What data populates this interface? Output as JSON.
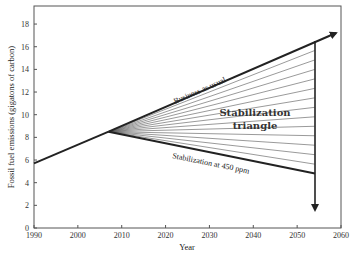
{
  "chart_data": {
    "type": "line",
    "title": "",
    "xlabel": "Year",
    "ylabel": "Fossil fuel emissions (gigatons of carbon)",
    "xlim": [
      1990,
      2060
    ],
    "ylim": [
      0,
      19
    ],
    "x_ticks": [
      1990,
      2000,
      2010,
      2020,
      2030,
      2040,
      2050,
      2060
    ],
    "y_ticks": [
      0,
      2,
      4,
      6,
      8,
      10,
      12,
      14,
      16,
      18
    ],
    "grid": false,
    "series": [
      {
        "name": "Historical",
        "x": [
          1990,
          2007
        ],
        "y": [
          5.7,
          8.5
        ]
      },
      {
        "name": "Business as usual",
        "x": [
          2007,
          2054,
          2059
        ],
        "y": [
          8.5,
          16.5,
          17.2
        ]
      },
      {
        "name": "Stabilization at 450 ppm",
        "x": [
          2007,
          2054
        ],
        "y": [
          8.5,
          4.8
        ]
      },
      {
        "name": "Reduction arrow (2054)",
        "x": [
          2054,
          2054
        ],
        "y": [
          16.5,
          1.6
        ]
      }
    ],
    "fan_lines": {
      "count": 14,
      "origin": [
        2007,
        8.5
      ],
      "end_year": 2054,
      "from": 16.5,
      "to": 4.8
    },
    "annotations": [
      {
        "text": "Business as usual",
        "x": 2025,
        "y": 12.5
      },
      {
        "text": "Stabilization triangle",
        "x": 2039,
        "y": 10
      },
      {
        "text": "Stabilization at 450 ppm",
        "x": 2030,
        "y": 6
      }
    ]
  },
  "labels": {
    "xlabel": "Year",
    "ylabel": "Fossil fuel emissions (gigatons of carbon)",
    "bau": "Business as usual",
    "stab_triangle_1": "Stabilization",
    "stab_triangle_2": "triangle",
    "stab_450": "Stabilization at 450 ppm"
  }
}
